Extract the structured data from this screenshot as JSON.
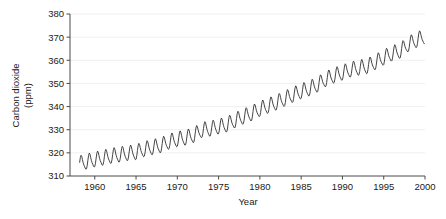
{
  "chart_data": {
    "type": "line",
    "title": "",
    "xlabel": "Year",
    "ylabel": "Carbon dioxide (ppm)",
    "ylabel_line1": "Carbon dioxide",
    "ylabel_line2": "(ppm)",
    "xlim": [
      1957.0,
      2000.0
    ],
    "ylim": [
      310,
      380
    ],
    "xticks": [
      1960,
      1965,
      1970,
      1975,
      1980,
      1985,
      1990,
      1995,
      2000
    ],
    "xtick_labels": [
      "1960",
      "1965",
      "1970",
      "1975",
      "1980",
      "1985",
      "1990",
      "1995",
      "2000"
    ],
    "yticks": [
      310,
      320,
      330,
      340,
      350,
      360,
      370,
      380
    ],
    "ytick_labels": [
      "310",
      "320",
      "330",
      "340",
      "350",
      "360",
      "370",
      "380"
    ],
    "grid": "horizontal-faint",
    "legend": "none",
    "line_color": "#303030",
    "line_width": 0.9,
    "series": [
      {
        "name": "Atmospheric CO2 (Mauna Loa monthly mean)",
        "seasonal_amplitude_ppm": 3.1,
        "x": [
          1958.2,
          1958.5,
          1958.8,
          1959.0,
          1959.3,
          1959.5,
          1959.8,
          1960.0,
          1960.3,
          1960.5,
          1960.8,
          1961.0,
          1961.3,
          1961.5,
          1961.8,
          1962.0,
          1962.3,
          1962.5,
          1962.8,
          1963.0,
          1963.3,
          1963.5,
          1963.8,
          1964.0,
          1964.3,
          1964.5,
          1964.8,
          1965.0,
          1965.3,
          1965.5,
          1965.8,
          1966.0,
          1966.3,
          1966.5,
          1966.8,
          1967.0,
          1967.3,
          1967.5,
          1967.8,
          1968.0,
          1968.3,
          1968.5,
          1968.8,
          1969.0,
          1969.3,
          1969.5,
          1969.8,
          1970.0,
          1970.3,
          1970.5,
          1970.8,
          1971.0,
          1971.3,
          1971.5,
          1971.8,
          1972.0,
          1972.3,
          1972.5,
          1972.8,
          1973.0,
          1973.3,
          1973.5,
          1973.8,
          1974.0,
          1974.3,
          1974.5,
          1974.8,
          1975.0,
          1975.3,
          1975.5,
          1975.8,
          1976.0,
          1976.3,
          1976.5,
          1976.8,
          1977.0,
          1977.3,
          1977.5,
          1977.8,
          1978.0,
          1978.3,
          1978.5,
          1978.8,
          1979.0,
          1979.3,
          1979.5,
          1979.8,
          1980.0,
          1980.3,
          1980.5,
          1980.8,
          1981.0,
          1981.3,
          1981.5,
          1981.8,
          1982.0,
          1982.3,
          1982.5,
          1982.8,
          1983.0,
          1983.3,
          1983.5,
          1983.8,
          1984.0,
          1984.3,
          1984.5,
          1984.8,
          1985.0,
          1985.3,
          1985.5,
          1985.8,
          1986.0,
          1986.3,
          1986.5,
          1986.8,
          1987.0,
          1987.3,
          1987.5,
          1987.8,
          1988.0,
          1988.3,
          1988.5,
          1988.8,
          1989.0,
          1989.3,
          1989.5,
          1989.8,
          1990.0,
          1990.3,
          1990.5,
          1990.8,
          1991.0,
          1991.3,
          1991.5,
          1991.8,
          1992.0,
          1992.3,
          1992.5,
          1992.8,
          1993.0,
          1993.3,
          1993.5,
          1993.8,
          1994.0,
          1994.3,
          1994.5,
          1994.8,
          1995.0,
          1995.3,
          1995.5,
          1995.8,
          1996.0,
          1996.3,
          1996.5,
          1996.8,
          1997.0,
          1997.3,
          1997.5,
          1997.8,
          1998.0,
          1998.3,
          1998.5,
          1998.8,
          1999.0,
          1999.3,
          1999.5,
          1999.8
        ],
        "annual_mean_x": [
          1959,
          1960,
          1961,
          1962,
          1963,
          1964,
          1965,
          1966,
          1967,
          1968,
          1969,
          1970,
          1971,
          1972,
          1973,
          1974,
          1975,
          1976,
          1977,
          1978,
          1979,
          1980,
          1981,
          1982,
          1983,
          1984,
          1985,
          1986,
          1987,
          1988,
          1989,
          1990,
          1991,
          1992,
          1993,
          1994,
          1995,
          1996,
          1997,
          1998,
          1999
        ],
        "annual_mean_y": [
          315.97,
          316.91,
          317.64,
          318.45,
          318.99,
          319.62,
          320.04,
          321.37,
          322.18,
          323.05,
          324.62,
          325.68,
          326.32,
          327.46,
          329.68,
          330.19,
          331.12,
          332.03,
          333.84,
          335.41,
          336.84,
          338.76,
          340.12,
          341.48,
          343.15,
          344.85,
          346.35,
          347.61,
          349.31,
          351.69,
          353.2,
          354.41,
          355.78,
          356.54,
          357.21,
          358.96,
          360.97,
          362.74,
          363.88,
          366.84,
          368.54
        ],
        "start_value_ppm": 315.7,
        "end_value_ppm": 368.5,
        "peak_value_ppm": 370.5,
        "trough_value_ppm": 313.9
      }
    ]
  }
}
